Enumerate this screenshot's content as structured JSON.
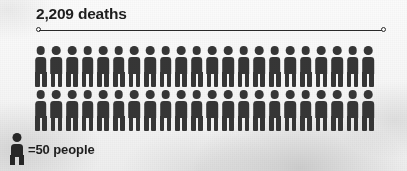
{
  "chart_data": {
    "type": "pictogram",
    "title": "2,209 deaths",
    "value": 2209,
    "unit_label": "deaths",
    "icon_value": 50,
    "legend_text": "=50 people",
    "legend_icon": "person-icon",
    "rows": [
      {
        "count": 22
      },
      {
        "count": 22
      }
    ],
    "total_icons": 44,
    "xlabel": "",
    "ylabel": "",
    "grid": false,
    "legend_position": "bottom-left",
    "colors": {
      "figure": "#363636",
      "legend_figure": "#272727",
      "text": "#1e1e1e",
      "rule": "#2b2b2b",
      "background": "#f7f7f7"
    },
    "measure_bar": {
      "visible": true,
      "endpoint_style": "open-circle"
    }
  }
}
